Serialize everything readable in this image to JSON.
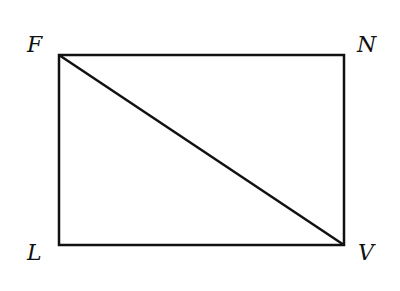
{
  "diagram": {
    "type": "rectangle-with-diagonal",
    "stroke_color": "#111111",
    "background": "#ffffff",
    "vertices": {
      "F": {
        "label": "F",
        "x": 59,
        "y": 55
      },
      "N": {
        "label": "N",
        "x": 344,
        "y": 55
      },
      "L": {
        "label": "L",
        "x": 59,
        "y": 245
      },
      "V": {
        "label": "V",
        "x": 344,
        "y": 245
      }
    },
    "segments": [
      {
        "from": "F",
        "to": "N"
      },
      {
        "from": "N",
        "to": "V"
      },
      {
        "from": "V",
        "to": "L"
      },
      {
        "from": "L",
        "to": "F"
      },
      {
        "from": "F",
        "to": "V",
        "role": "diagonal"
      }
    ]
  }
}
